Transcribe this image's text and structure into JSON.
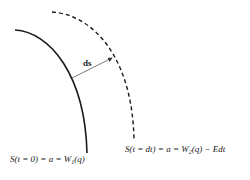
{
  "diagram": {
    "curves": [
      {
        "id": "initial-surface",
        "style": "solid",
        "color": "#1a1a1a"
      },
      {
        "id": "evolved-surface",
        "style": "dashed",
        "color": "#1a1a1a"
      }
    ],
    "arrow": {
      "label": "ds",
      "color": "#555555"
    },
    "labels": {
      "initial": {
        "prefix": "S(t = 0) = a = W",
        "subscript": "1",
        "suffix": "(q)"
      },
      "evolved": {
        "prefix": "S(t = dt) = a = W",
        "subscript": "2",
        "suffix": "(q) − Edt"
      }
    }
  }
}
